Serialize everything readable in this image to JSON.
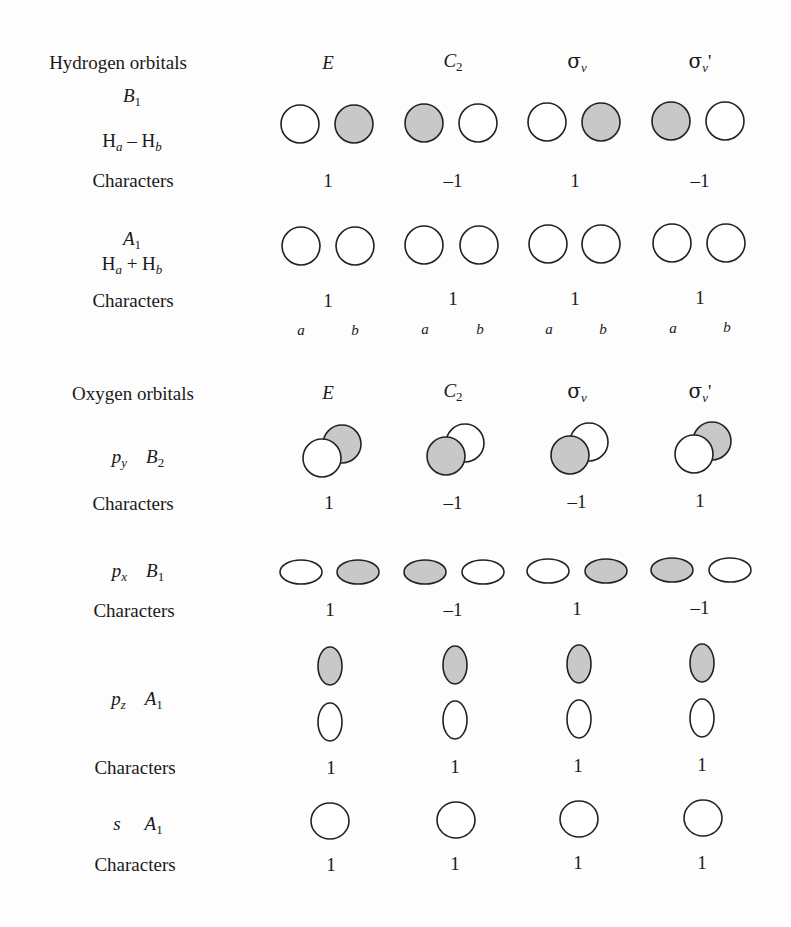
{
  "hydrogen": {
    "title": "Hydrogen orbitals",
    "operations": [
      "E",
      "C",
      "σ",
      "σ"
    ],
    "op_subscripts": [
      "",
      "2",
      "v",
      "v"
    ],
    "op_primes": [
      "",
      "",
      "",
      "'"
    ],
    "b1": {
      "symbol": "B",
      "subscript": "1",
      "combo_left": "H",
      "combo_left_sub": "a",
      "combo_op": "–",
      "combo_right": "H",
      "combo_right_sub": "b",
      "characters_label": "Characters",
      "characters": [
        "1",
        "–1",
        "1",
        "–1"
      ]
    },
    "a1": {
      "symbol": "A",
      "subscript": "1",
      "combo_left": "H",
      "combo_left_sub": "a",
      "combo_op": "+",
      "combo_right": "H",
      "combo_right_sub": "b",
      "characters_label": "Characters",
      "characters": [
        "1",
        "1",
        "1",
        "1"
      ]
    },
    "atom_labels": [
      "a",
      "b"
    ]
  },
  "oxygen": {
    "title": "Oxygen orbitals",
    "py": {
      "orbital": "p",
      "orbital_sub": "y",
      "symbol": "B",
      "subscript": "2",
      "characters_label": "Characters",
      "characters": [
        "1",
        "–1",
        "–1",
        "1"
      ]
    },
    "px": {
      "orbital": "p",
      "orbital_sub": "x",
      "symbol": "B",
      "subscript": "1",
      "characters_label": "Characters",
      "characters": [
        "1",
        "–1",
        "1",
        "–1"
      ]
    },
    "pz": {
      "orbital": "p",
      "orbital_sub": "z",
      "symbol": "A",
      "subscript": "1",
      "characters_label": "Characters",
      "characters": [
        "1",
        "1",
        "1",
        "1"
      ]
    },
    "s": {
      "orbital": "s",
      "symbol": "A",
      "subscript": "1",
      "characters_label": "Characters",
      "characters": [
        "1",
        "1",
        "1",
        "1"
      ]
    }
  },
  "colors": {
    "shaded_lobe": "#c8c8c8",
    "outline": "#222222"
  }
}
